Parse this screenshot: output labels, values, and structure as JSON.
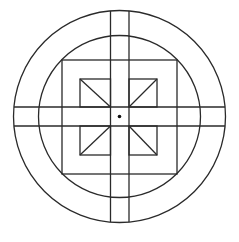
{
  "diagram": {
    "type": "geometric-figure",
    "colors": {
      "stroke": "#2a2a2a",
      "background": "#ffffff",
      "dot": "#111111"
    },
    "center": {
      "x": 119.5,
      "y": 116.5
    },
    "outer_circle_radius": 106,
    "inner_circle_radius": 81,
    "vertical_band": {
      "x1": 110.5,
      "x2": 129
    },
    "horizontal_band": {
      "y1": 107,
      "y2": 126
    },
    "big_square": {
      "x": 62,
      "y": 60,
      "width": 115,
      "height": 114
    },
    "small_squares": [
      {
        "name": "top-left",
        "x1": 80,
        "y1": 79,
        "x2": 110.5,
        "y2": 107,
        "diag": [
          80,
          79,
          110.5,
          107
        ]
      },
      {
        "name": "top-right",
        "x1": 129,
        "y1": 79,
        "x2": 157,
        "y2": 107,
        "diag": [
          157,
          79,
          129,
          107
        ]
      },
      {
        "name": "bottom-left",
        "x1": 80,
        "y1": 126,
        "x2": 110.5,
        "y2": 155,
        "diag": [
          80,
          155,
          110.5,
          126
        ]
      },
      {
        "name": "bottom-right",
        "x1": 129,
        "y1": 126,
        "x2": 157,
        "y2": 155,
        "diag": [
          157,
          155,
          129,
          126
        ]
      }
    ],
    "center_dot_radius": 1.8
  }
}
